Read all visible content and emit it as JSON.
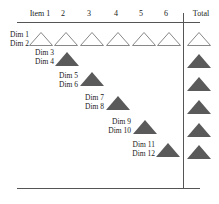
{
  "diagram": {
    "header": {
      "columns": [
        "Item 1",
        "2",
        "3",
        "4",
        "5",
        "6"
      ],
      "total_label": "Total"
    },
    "rows": [
      {
        "labels": [
          "Dim 1",
          "Dim 2"
        ],
        "column": "all",
        "style": "outline"
      },
      {
        "labels": [
          "Dim 3",
          "Dim 4"
        ],
        "column": 2,
        "style": "filled"
      },
      {
        "labels": [
          "Dim 5",
          "Dim 6"
        ],
        "column": 3,
        "style": "filled"
      },
      {
        "labels": [
          "Dim 7",
          "Dim 8"
        ],
        "column": 4,
        "style": "filled"
      },
      {
        "labels": [
          "Dim 9",
          "Dim 10"
        ],
        "column": 5,
        "style": "filled"
      },
      {
        "labels": [
          "Dim 11",
          "Dim 12"
        ],
        "column": 6,
        "style": "filled"
      }
    ],
    "total_column": [
      "outline",
      "filled",
      "filled",
      "filled",
      "filled",
      "filled"
    ],
    "colors": {
      "filled": "#5a5a5a",
      "outline_stroke": "#888888",
      "line": "#555555"
    }
  }
}
